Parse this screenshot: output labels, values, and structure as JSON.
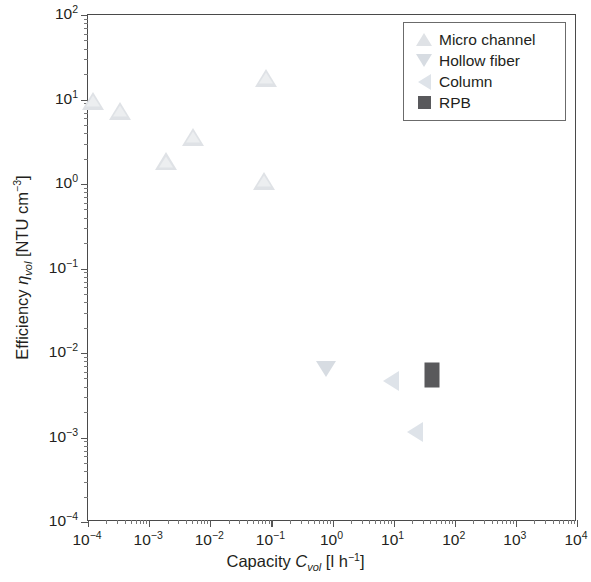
{
  "figure": {
    "background_color": "#ffffff",
    "frame_color": "#4a4a4a"
  },
  "axes": {
    "x_title_prefix": "Capacity ",
    "x_title_symbol": "C",
    "x_title_subscript": "vol",
    "x_title_units": " [l h",
    "x_title_units_exp": "−1",
    "x_title_units_close": "]",
    "y_title_prefix": "Efficiency ",
    "y_title_symbol": "η",
    "y_title_subscript": "vol",
    "y_title_units": " [NTU cm",
    "y_title_units_exp": "−3",
    "y_title_units_close": "]",
    "x_ticks": [
      "10⁻⁴",
      "10⁻³",
      "10⁻²",
      "10⁻¹",
      "10⁰",
      "10¹",
      "10²",
      "10³",
      "10⁴"
    ],
    "x_tick_mantissa": [
      "10",
      "10",
      "10",
      "10",
      "10",
      "10",
      "10",
      "10",
      "10"
    ],
    "x_tick_exponents": [
      "-4",
      "-3",
      "-2",
      "-1",
      "0",
      "1",
      "2",
      "3",
      "4"
    ],
    "y_tick_mantissa": [
      "10",
      "10",
      "10",
      "10",
      "10",
      "10",
      "10"
    ],
    "y_tick_exponents": [
      "2",
      "1",
      "0",
      "-1",
      "-2",
      "-3",
      "-4"
    ],
    "x_scale": "log",
    "y_scale": "log",
    "xlim": [
      0.0001,
      10000
    ],
    "ylim": [
      0.0001,
      100
    ],
    "grid": false,
    "ticks_direction": "out"
  },
  "legend": {
    "position": "top-right",
    "border_color": "#6b6b6b",
    "items": [
      {
        "label": "Micro channel",
        "marker": "triangle-up",
        "color": "#dfe2e6"
      },
      {
        "label": "Hollow fiber",
        "marker": "triangle-down",
        "color": "#d7dce2"
      },
      {
        "label": "Column",
        "marker": "triangle-left",
        "color": "#dee3e9"
      },
      {
        "label": "RPB",
        "marker": "square",
        "color": "#59595c"
      }
    ]
  },
  "chart_data": {
    "type": "scatter",
    "title": "",
    "xlabel": "Capacity C_vol [l h⁻¹]",
    "ylabel": "Efficiency η_vol [NTU cm⁻³]",
    "xscale": "log",
    "yscale": "log",
    "xlim": [
      0.0001,
      10000
    ],
    "ylim": [
      0.0001,
      100
    ],
    "grid": false,
    "legend_position": "upper right",
    "series": [
      {
        "name": "Micro channel",
        "marker": "triangle-up",
        "color": "#dfe2e6",
        "points": [
          {
            "x": 0.00012,
            "y": 9.6
          },
          {
            "x": 0.00033,
            "y": 7.4
          },
          {
            "x": 0.0019,
            "y": 1.85
          },
          {
            "x": 0.0052,
            "y": 3.6
          },
          {
            "x": 0.075,
            "y": 1.1
          },
          {
            "x": 0.082,
            "y": 18.0
          }
        ]
      },
      {
        "name": "Hollow fiber",
        "marker": "triangle-down",
        "color": "#d7dce2",
        "points": [
          {
            "x": 0.78,
            "y": 0.0065
          }
        ]
      },
      {
        "name": "Column",
        "marker": "triangle-left",
        "color": "#dee3e9",
        "points": [
          {
            "x": 9.0,
            "y": 0.0047
          },
          {
            "x": 22.0,
            "y": 0.00115
          }
        ]
      },
      {
        "name": "RPB",
        "marker": "square",
        "color": "#59595c",
        "points": [
          {
            "x": 43.0,
            "y": 0.0055
          }
        ]
      }
    ]
  }
}
